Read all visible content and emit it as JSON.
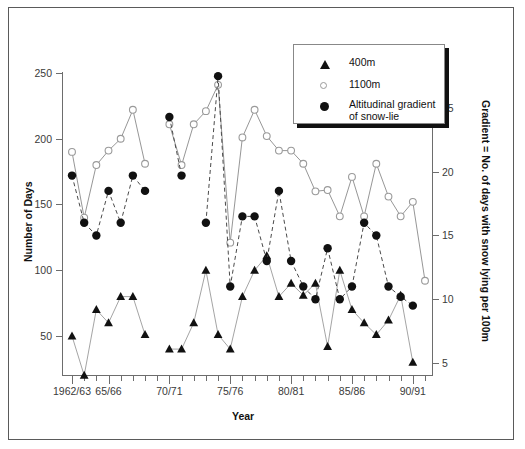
{
  "chart_data": {
    "type": "line",
    "title": "",
    "xlabel": "Year",
    "ylabel": "Number of Days",
    "ylabel_right": "Gradient = No. of days with snow lying per 100m",
    "grid": false,
    "legend_position": "top-right",
    "ylim": [
      0,
      250
    ],
    "yticks": [
      50,
      100,
      150,
      200,
      250
    ],
    "ylim_right": [
      0,
      27
    ],
    "yticks_right": [
      5,
      10,
      15,
      20,
      25
    ],
    "x_categories": [
      "1962/63",
      "63/64",
      "64/65",
      "65/66",
      "66/67",
      "67/68",
      "68/69",
      "69/70",
      "70/71",
      "71/72",
      "72/73",
      "73/74",
      "74/75",
      "75/76",
      "76/77",
      "77/78",
      "78/79",
      "79/80",
      "80/81",
      "81/82",
      "82/83",
      "83/84",
      "84/85",
      "85/86",
      "86/87",
      "87/88",
      "88/89",
      "89/90",
      "90/91",
      "91/92"
    ],
    "xtick_labels": [
      "1962/63",
      "65/66",
      "70/71",
      "75/76",
      "80/81",
      "85/86",
      "90/91"
    ],
    "xtick_indices": [
      0,
      3,
      8,
      13,
      18,
      23,
      28
    ],
    "series": [
      {
        "name": "400m",
        "marker": "filled-triangle",
        "axis": "left",
        "values": [
          50,
          20,
          70,
          60,
          80,
          80,
          51,
          null,
          40,
          40,
          60,
          100,
          51,
          40,
          80,
          100,
          111,
          80,
          90,
          81,
          90,
          42,
          100,
          70,
          60,
          51,
          62,
          81,
          30,
          null
        ]
      },
      {
        "name": "1100m",
        "marker": "open-circle",
        "axis": "left",
        "values": [
          190,
          140,
          180,
          191,
          200,
          222,
          181,
          null,
          211,
          180,
          211,
          221,
          241,
          121,
          201,
          222,
          202,
          191,
          191,
          181,
          160,
          161,
          141,
          171,
          141,
          181,
          156,
          141,
          152,
          92
        ]
      },
      {
        "name": "Altitudinal gradient of snow-lie",
        "marker": "filled-circle",
        "axis": "right",
        "values": [
          19.7,
          16.0,
          15.0,
          18.5,
          16.0,
          19.7,
          18.5,
          null,
          24.3,
          19.7,
          null,
          16.0,
          27.5,
          11.0,
          16.5,
          16.5,
          13.0,
          18.5,
          13.0,
          11.0,
          10.0,
          14.0,
          10.0,
          11.0,
          16.0,
          15.0,
          11.0,
          10.2,
          9.5,
          null
        ]
      }
    ]
  },
  "legend": {
    "items": [
      {
        "label": "400m",
        "marker": "filled-triangle"
      },
      {
        "label": "1100m",
        "marker": "open-circle"
      },
      {
        "label": "Altitudinal gradient\nof snow-lie",
        "marker": "filled-circle"
      }
    ]
  },
  "axes": {
    "left_title": "Number of Days",
    "right_title": "Gradient = No. of days with snow lying per 100m",
    "bottom_title": "Year",
    "left_ticks": [
      "250",
      "200",
      "150",
      "100",
      "50"
    ],
    "right_ticks": [
      "25",
      "20",
      "15",
      "10",
      "5"
    ],
    "bottom_ticks": [
      "1962/63",
      "65/66",
      "70/71",
      "75/76",
      "80/81",
      "85/86",
      "90/91"
    ]
  },
  "colors": {
    "axis": "#6d6d6d",
    "text": "#3a3a3a",
    "line_1100m": "#8a8a8a",
    "line_400m": "#9a9a9a",
    "line_gradient": "#4a4a4a",
    "marker_fill": "#111111",
    "marker_open_stroke": "#9a9a9a",
    "frame": "#5a5a5a"
  }
}
